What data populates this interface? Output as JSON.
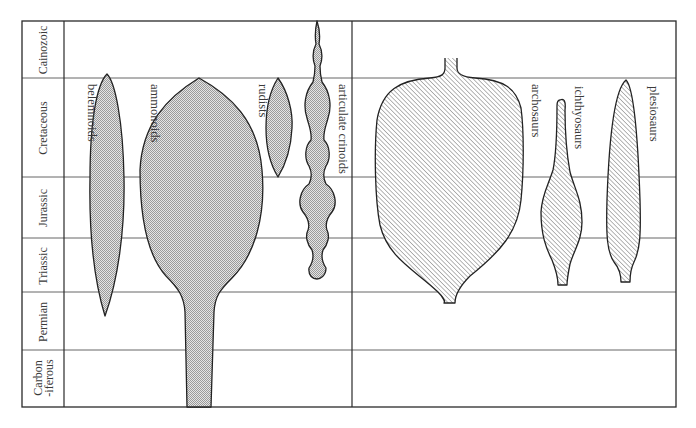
{
  "periods": [
    {
      "label": "Cainozoic"
    },
    {
      "label": "Cretaceous"
    },
    {
      "label": "Jurassic"
    },
    {
      "label": "Triassic"
    },
    {
      "label": "Permian"
    },
    {
      "label": "Carbon\n-iferous",
      "lines": [
        "Carbon",
        "-iferous"
      ]
    }
  ],
  "groups": [
    {
      "label": "belemnoids",
      "fill": "stipple",
      "panel": "invertebrates"
    },
    {
      "label": "ammonoids",
      "fill": "stipple",
      "panel": "invertebrates"
    },
    {
      "label": "rudists",
      "fill": "stipple",
      "panel": "invertebrates"
    },
    {
      "label": "articulate crinoids",
      "fill": "stipple",
      "panel": "invertebrates"
    },
    {
      "label": "archosaurs",
      "fill": "hatch",
      "panel": "reptiles"
    },
    {
      "label": "ichthyosaurs",
      "fill": "hatch",
      "panel": "reptiles"
    },
    {
      "label": "plesiosaurs",
      "fill": "hatch",
      "panel": "reptiles"
    }
  ],
  "colors": {
    "line": "#222222",
    "stipple_fill": "#bdbdbd",
    "hatch_line": "#6e6e6e",
    "background": "#ffffff"
  }
}
